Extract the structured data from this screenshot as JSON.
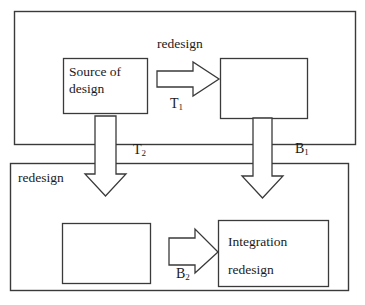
{
  "diagram": {
    "type": "block-flow-diagram",
    "title": "",
    "stroke_color": "#3a3a3a",
    "fill_color": "#ffffff",
    "background": "#ffffff",
    "containers": [
      {
        "id": "top-phase",
        "name": "top-phase-container",
        "label": ""
      },
      {
        "id": "bottom-phase",
        "name": "bottom-phase-container",
        "label": ""
      }
    ],
    "boxes": [
      {
        "id": "source-of-design",
        "lines": [
          "Source of",
          "design"
        ],
        "line1": "Source of",
        "line2": "design"
      },
      {
        "id": "top-right-empty",
        "lines": [],
        "line1": "",
        "line2": ""
      },
      {
        "id": "bottom-left-empty",
        "lines": [],
        "line1": "",
        "line2": ""
      },
      {
        "id": "integration-redesign",
        "lines": [
          "Integration",
          "redesign"
        ],
        "line1": "Integration",
        "line2": "redesign"
      }
    ],
    "arrows": [
      {
        "id": "arrow-t1",
        "direction": "right",
        "above_label": "redesign",
        "below_label": "T",
        "below_label_sub": "1"
      },
      {
        "id": "arrow-t2",
        "direction": "down",
        "side_label": "T",
        "side_label_sub": "2",
        "extra_label": "redesign"
      },
      {
        "id": "arrow-b1",
        "direction": "down",
        "side_label": "B",
        "side_label_sub": "1"
      },
      {
        "id": "arrow-b2",
        "direction": "right",
        "below_label": "B",
        "below_label_sub": "2"
      }
    ],
    "labels": {
      "redesign_top": "redesign",
      "redesign_left": "redesign",
      "t1": "T",
      "t1_sub": "1",
      "t2": "T",
      "t2_sub": "2",
      "b1": "B",
      "b1_sub": "1",
      "b2": "B",
      "b2_sub": "2",
      "source_line1": "Source of",
      "source_line2": "design",
      "integration_line1": "Integration",
      "integration_line2": "redesign"
    }
  }
}
